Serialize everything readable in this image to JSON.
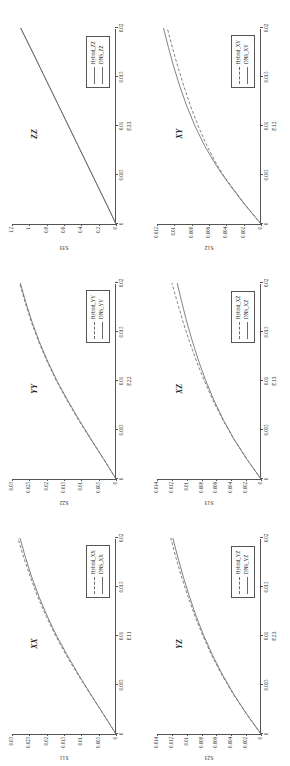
{
  "figure": {
    "layout": "2 columns x 3 rows of stress-strain plots, each rotated 90 degrees counter-clockwise",
    "line_color": "#6b6b6b",
    "axis_color": "#555555"
  },
  "chart_data": [
    {
      "id": "zz",
      "type": "line",
      "title": "ZZ",
      "xlabel": "E33",
      "ylabel": "S33",
      "xlim": [
        0,
        0.02
      ],
      "ylim": [
        0,
        1.2
      ],
      "xticks": [
        "0",
        "0.005",
        "0.01",
        "0.015",
        "0.02"
      ],
      "xtick_values": [
        0,
        0.005,
        0.01,
        0.015,
        0.02
      ],
      "yticks": [
        "0",
        "0.2",
        "0.4",
        "0.6",
        "0.8",
        "1",
        "1.2"
      ],
      "ytick_values": [
        0,
        0.2,
        0.4,
        0.6,
        0.8,
        1,
        1.2
      ],
      "grid": false,
      "legend_position": "lower right",
      "series": [
        {
          "name": "Hybrid_ZZ",
          "style": "solid",
          "x": [
            0,
            0.002,
            0.004,
            0.006,
            0.008,
            0.01,
            0.012,
            0.014,
            0.016,
            0.018,
            0.02
          ],
          "values": [
            0,
            0.108,
            0.218,
            0.328,
            0.438,
            0.548,
            0.658,
            0.768,
            0.878,
            0.988,
            1.1
          ]
        },
        {
          "name": "DNS_ZZ",
          "style": "solid",
          "x": [
            0,
            0.002,
            0.004,
            0.006,
            0.008,
            0.01,
            0.012,
            0.014,
            0.016,
            0.018,
            0.02
          ],
          "values": [
            0,
            0.108,
            0.218,
            0.328,
            0.438,
            0.548,
            0.658,
            0.768,
            0.878,
            0.988,
            1.1
          ]
        }
      ]
    },
    {
      "id": "xy",
      "type": "line",
      "title": "XY",
      "xlabel": "E12",
      "ylabel": "S12",
      "xlim": [
        0,
        0.02
      ],
      "ylim": [
        0,
        0.012
      ],
      "xticks": [
        "0",
        "0.005",
        "0.01",
        "0.015",
        "0.02"
      ],
      "xtick_values": [
        0,
        0.005,
        0.01,
        0.015,
        0.02
      ],
      "yticks": [
        "0",
        "0.002",
        "0.004",
        "0.006",
        "0.008",
        "0.01",
        "0.012"
      ],
      "ytick_values": [
        0,
        0.002,
        0.004,
        0.006,
        0.008,
        0.01,
        0.012
      ],
      "grid": false,
      "legend_position": "lower right",
      "series": [
        {
          "name": "Hybrid_XY",
          "style": "dashed",
          "x": [
            0,
            0.002,
            0.004,
            0.005,
            0.006,
            0.008,
            0.01,
            0.012,
            0.014,
            0.016,
            0.018,
            0.02
          ],
          "values": [
            0,
            0.00185,
            0.00355,
            0.00435,
            0.00505,
            0.00625,
            0.00725,
            0.00812,
            0.00888,
            0.00958,
            0.01022,
            0.01082
          ]
        },
        {
          "name": "DNS_XY",
          "style": "solid",
          "x": [
            0,
            0.002,
            0.004,
            0.005,
            0.006,
            0.008,
            0.01,
            0.012,
            0.014,
            0.016,
            0.018,
            0.02
          ],
          "values": [
            0,
            0.0019,
            0.00362,
            0.00442,
            0.00518,
            0.00652,
            0.00762,
            0.00855,
            0.00935,
            0.01005,
            0.01068,
            0.01125
          ]
        }
      ]
    },
    {
      "id": "yy",
      "type": "line",
      "title": "YY",
      "xlabel": "E22",
      "ylabel": "S22",
      "xlim": [
        0,
        0.02
      ],
      "ylim": [
        0,
        0.03
      ],
      "xticks": [
        "0",
        "0.005",
        "0.01",
        "0.015",
        "0.02"
      ],
      "xtick_values": [
        0,
        0.005,
        0.01,
        0.015,
        0.02
      ],
      "yticks": [
        "0",
        "0.005",
        "0.01",
        "0.015",
        "0.02",
        "0.025",
        "0.03"
      ],
      "ytick_values": [
        0,
        0.005,
        0.01,
        0.015,
        0.02,
        0.025,
        0.03
      ],
      "grid": false,
      "legend_position": "lower right",
      "series": [
        {
          "name": "Hybrid_YY",
          "style": "dashed",
          "x": [
            0,
            0.002,
            0.004,
            0.006,
            0.008,
            0.01,
            0.012,
            0.014,
            0.016,
            0.018,
            0.02
          ],
          "values": [
            0,
            0.0035,
            0.0072,
            0.0108,
            0.0141,
            0.0172,
            0.0199,
            0.0223,
            0.0244,
            0.0262,
            0.0278
          ]
        },
        {
          "name": "DNS_YY",
          "style": "solid",
          "x": [
            0,
            0.002,
            0.004,
            0.006,
            0.008,
            0.01,
            0.012,
            0.014,
            0.016,
            0.018,
            0.02
          ],
          "values": [
            0,
            0.0035,
            0.0071,
            0.0106,
            0.0139,
            0.017,
            0.0197,
            0.0221,
            0.0242,
            0.026,
            0.0276
          ]
        }
      ]
    },
    {
      "id": "xz",
      "type": "line",
      "title": "XZ",
      "xlabel": "E13",
      "ylabel": "S13",
      "xlim": [
        0,
        0.02
      ],
      "ylim": [
        0,
        0.014
      ],
      "xticks": [
        "0",
        "0.005",
        "0.01",
        "0.015",
        "0.02"
      ],
      "xtick_values": [
        0,
        0.005,
        0.01,
        0.015,
        0.02
      ],
      "yticks": [
        "0",
        "0.002",
        "0.004",
        "0.006",
        "0.008",
        "0.01",
        "0.012",
        "0.014"
      ],
      "ytick_values": [
        0,
        0.002,
        0.004,
        0.006,
        0.008,
        0.01,
        0.012,
        0.014
      ],
      "grid": false,
      "legend_position": "lower right",
      "series": [
        {
          "name": "Hybrid_XZ",
          "style": "dashed",
          "x": [
            0,
            0.002,
            0.004,
            0.006,
            0.008,
            0.01,
            0.012,
            0.014,
            0.016,
            0.018,
            0.02
          ],
          "values": [
            0,
            0.00188,
            0.0036,
            0.00512,
            0.00645,
            0.00762,
            0.00868,
            0.00962,
            0.01048,
            0.01125,
            0.012
          ]
        },
        {
          "name": "DNS_XZ",
          "style": "solid",
          "x": [
            0,
            0.002,
            0.004,
            0.006,
            0.008,
            0.01,
            0.012,
            0.014,
            0.016,
            0.018,
            0.02
          ],
          "values": [
            0,
            0.00188,
            0.00358,
            0.00505,
            0.00632,
            0.00742,
            0.00838,
            0.00922,
            0.00998,
            0.01065,
            0.01128
          ]
        }
      ]
    },
    {
      "id": "xx",
      "type": "line",
      "title": "XX",
      "xlabel": "E11",
      "ylabel": "S11",
      "xlim": [
        0,
        0.02
      ],
      "ylim": [
        0,
        0.03
      ],
      "xticks": [
        "0",
        "0.005",
        "0.01",
        "0.015",
        "0.02"
      ],
      "xtick_values": [
        0,
        0.005,
        0.01,
        0.015,
        0.02
      ],
      "yticks": [
        "0",
        "0.005",
        "0.01",
        "0.015",
        "0.02",
        "0.025",
        "0.03"
      ],
      "ytick_values": [
        0,
        0.005,
        0.01,
        0.015,
        0.02,
        0.025,
        0.03
      ],
      "grid": false,
      "legend_position": "lower right",
      "series": [
        {
          "name": "Hybrid_XX",
          "style": "dashed",
          "x": [
            0,
            0.002,
            0.004,
            0.006,
            0.008,
            0.01,
            0.012,
            0.014,
            0.016,
            0.018,
            0.02
          ],
          "values": [
            0,
            0.0036,
            0.0073,
            0.0109,
            0.0143,
            0.0174,
            0.0201,
            0.0226,
            0.0247,
            0.0266,
            0.0283
          ]
        },
        {
          "name": "DNS_XX",
          "style": "solid",
          "x": [
            0,
            0.002,
            0.004,
            0.006,
            0.008,
            0.01,
            0.012,
            0.014,
            0.016,
            0.018,
            0.02
          ],
          "values": [
            0,
            0.0036,
            0.0072,
            0.0107,
            0.014,
            0.0171,
            0.0198,
            0.0222,
            0.0243,
            0.0261,
            0.0277
          ]
        }
      ]
    },
    {
      "id": "yz",
      "type": "line",
      "title": "YZ",
      "xlabel": "E23",
      "ylabel": "S23",
      "xlim": [
        0,
        0.02
      ],
      "ylim": [
        0,
        0.014
      ],
      "xticks": [
        "0",
        "0.005",
        "0.01",
        "0.015",
        "0.02"
      ],
      "xtick_values": [
        0,
        0.005,
        0.01,
        0.015,
        0.02
      ],
      "yticks": [
        "0",
        "0.002",
        "0.004",
        "0.006",
        "0.008",
        "0.01",
        "0.012",
        "0.014"
      ],
      "ytick_values": [
        0,
        0.002,
        0.004,
        0.006,
        0.008,
        0.01,
        0.012,
        0.014
      ],
      "grid": false,
      "legend_position": "lower right",
      "series": [
        {
          "name": "Hybrid_YZ",
          "style": "dashed",
          "x": [
            0,
            0.002,
            0.004,
            0.006,
            0.008,
            0.01,
            0.012,
            0.014,
            0.016,
            0.018,
            0.02
          ],
          "values": [
            0,
            0.00192,
            0.00368,
            0.00525,
            0.00662,
            0.00782,
            0.00888,
            0.00982,
            0.01068,
            0.01145,
            0.01215
          ]
        },
        {
          "name": "DNS_YZ",
          "style": "solid",
          "x": [
            0,
            0.002,
            0.004,
            0.006,
            0.008,
            0.01,
            0.012,
            0.014,
            0.016,
            0.018,
            0.02
          ],
          "values": [
            0,
            0.0019,
            0.00362,
            0.00515,
            0.0065,
            0.00768,
            0.00872,
            0.00962,
            0.01045,
            0.01118,
            0.01188
          ]
        }
      ]
    }
  ]
}
